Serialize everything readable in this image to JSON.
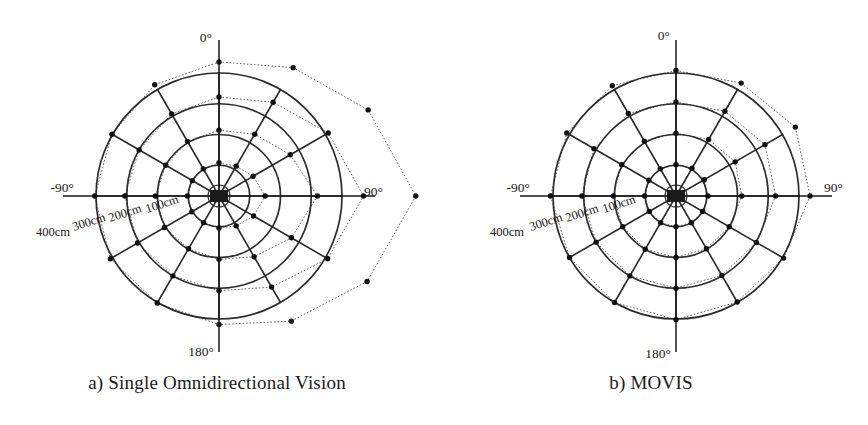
{
  "figure": {
    "background": "#ffffff",
    "ink": "#1a1a1a",
    "grid_color": "#2b2b2b",
    "measured_color": "#555555",
    "point_color": "#111111"
  },
  "panels": [
    {
      "id": "a",
      "caption": "a) Single Omnidirectional Vision",
      "center": {
        "x": 219,
        "y": 196
      },
      "angle_labels": [
        {
          "name": "angle-label-0",
          "text": "0°",
          "x": 212,
          "y": 42,
          "anchor": "end"
        },
        {
          "name": "angle-label-90",
          "text": "90°",
          "x": 364,
          "y": 196,
          "anchor": "start"
        },
        {
          "name": "angle-label-180",
          "text": "180°",
          "x": 214,
          "y": 356,
          "anchor": "end"
        },
        {
          "name": "angle-label-minus90",
          "text": "-90°",
          "x": 74,
          "y": 192,
          "anchor": "end"
        }
      ],
      "radius_labels": [
        {
          "name": "radius-label-100cm",
          "text": "100cm",
          "x": 147,
          "y": 213,
          "rotate": -18
        },
        {
          "name": "radius-label-200cm",
          "text": "200cm",
          "x": 110,
          "y": 222,
          "rotate": -18
        },
        {
          "name": "radius-label-300cm",
          "text": "300cm",
          "x": 74,
          "y": 231,
          "rotate": -18
        },
        {
          "name": "radius-label-400cm",
          "text": "400cm",
          "x": 36,
          "y": 236,
          "rotate": 0
        }
      ]
    },
    {
      "id": "b",
      "caption": "b) MOVIS",
      "center": {
        "x": 242,
        "y": 196
      },
      "angle_labels": [
        {
          "name": "angle-label-0",
          "text": "0°",
          "x": 236,
          "y": 40,
          "anchor": "end"
        },
        {
          "name": "angle-label-90",
          "text": "90°",
          "x": 390,
          "y": 192,
          "anchor": "start"
        },
        {
          "name": "angle-label-180",
          "text": "180°",
          "x": 237,
          "y": 358,
          "anchor": "end"
        },
        {
          "name": "angle-label-minus90",
          "text": "-90°",
          "x": 96,
          "y": 192,
          "anchor": "end"
        }
      ],
      "radius_labels": [
        {
          "name": "radius-label-100cm",
          "text": "100cm",
          "x": 170,
          "y": 213,
          "rotate": -18
        },
        {
          "name": "radius-label-200cm",
          "text": "200cm",
          "x": 133,
          "y": 222,
          "rotate": -18
        },
        {
          "name": "radius-label-300cm",
          "text": "300cm",
          "x": 97,
          "y": 231,
          "rotate": -18
        },
        {
          "name": "radius-label-400cm",
          "text": "400cm",
          "x": 56,
          "y": 236,
          "rotate": 0
        }
      ]
    }
  ],
  "chart_data": [
    {
      "type": "line",
      "subtype": "polar-radar",
      "panel": "a",
      "title": "a) Single Omnidirectional Vision",
      "xlabel": "bearing angle (deg)",
      "ylabel": "distance (cm)",
      "rlim": [
        0,
        400
      ],
      "runit": "cm",
      "rticks": [
        100,
        200,
        300,
        400
      ],
      "rtick_labels": [
        "100cm",
        "200cm",
        "300cm",
        "400cm"
      ],
      "theta_zero_location": "N",
      "theta_direction": "clockwise",
      "thetaticks": [
        0,
        90,
        180,
        -90
      ],
      "thetatick_labels": [
        "0°",
        "90°",
        "180°",
        "-90°"
      ],
      "angles_deg": [
        0,
        30,
        60,
        90,
        120,
        150,
        180,
        210,
        240,
        270,
        300,
        330
      ],
      "grid": true,
      "legend": "none",
      "series": [
        {
          "name": "ground truth 100cm",
          "reference": true,
          "values": [
            100,
            100,
            100,
            100,
            100,
            100,
            100,
            100,
            100,
            100,
            100,
            100
          ]
        },
        {
          "name": "ground truth 200cm",
          "reference": true,
          "values": [
            200,
            200,
            200,
            200,
            200,
            200,
            200,
            200,
            200,
            200,
            200,
            200
          ]
        },
        {
          "name": "ground truth 300cm",
          "reference": true,
          "values": [
            300,
            300,
            300,
            300,
            300,
            300,
            300,
            300,
            300,
            300,
            300,
            300
          ]
        },
        {
          "name": "ground truth 400cm",
          "reference": true,
          "values": [
            400,
            400,
            400,
            400,
            400,
            400,
            400,
            400,
            400,
            400,
            400,
            400
          ]
        },
        {
          "name": "measured 100cm",
          "reference": false,
          "values": [
            108,
            112,
            128,
            150,
            130,
            112,
            104,
            100,
            102,
            103,
            100,
            102
          ]
        },
        {
          "name": "measured 200cm",
          "reference": false,
          "values": [
            214,
            232,
            268,
            320,
            272,
            228,
            206,
            198,
            205,
            207,
            200,
            205
          ]
        },
        {
          "name": "measured 300cm",
          "reference": false,
          "values": [
            322,
            352,
            410,
            470,
            408,
            342,
            308,
            300,
            306,
            306,
            300,
            308
          ]
        },
        {
          "name": "measured 400cm",
          "reference": false,
          "values": [
            436,
            482,
            560,
            640,
            556,
            470,
            418,
            402,
            408,
            404,
            402,
            418
          ]
        }
      ]
    },
    {
      "type": "line",
      "subtype": "polar-radar",
      "panel": "b",
      "title": "b) MOVIS",
      "xlabel": "bearing angle (deg)",
      "ylabel": "distance (cm)",
      "rlim": [
        0,
        400
      ],
      "runit": "cm",
      "rticks": [
        100,
        200,
        300,
        400
      ],
      "rtick_labels": [
        "100cm",
        "200cm",
        "300cm",
        "400cm"
      ],
      "theta_zero_location": "N",
      "theta_direction": "clockwise",
      "thetaticks": [
        0,
        90,
        180,
        -90
      ],
      "thetatick_labels": [
        "0°",
        "90°",
        "180°",
        "-90°"
      ],
      "angles_deg": [
        0,
        30,
        60,
        90,
        120,
        150,
        180,
        210,
        240,
        270,
        300,
        330
      ],
      "grid": true,
      "legend": "none",
      "series": [
        {
          "name": "ground truth 100cm",
          "reference": true,
          "values": [
            100,
            100,
            100,
            100,
            100,
            100,
            100,
            100,
            100,
            100,
            100,
            100
          ]
        },
        {
          "name": "ground truth 200cm",
          "reference": true,
          "values": [
            200,
            200,
            200,
            200,
            200,
            200,
            200,
            200,
            200,
            200,
            200,
            200
          ]
        },
        {
          "name": "ground truth 300cm",
          "reference": true,
          "values": [
            300,
            300,
            300,
            300,
            300,
            300,
            300,
            300,
            300,
            300,
            300,
            300
          ]
        },
        {
          "name": "ground truth 400cm",
          "reference": true,
          "values": [
            400,
            400,
            400,
            400,
            400,
            400,
            400,
            400,
            400,
            400,
            400,
            400
          ]
        },
        {
          "name": "measured 100cm",
          "reference": false,
          "values": [
            102,
            104,
            106,
            104,
            100,
            100,
            100,
            100,
            100,
            102,
            102,
            102
          ]
        },
        {
          "name": "measured 200cm",
          "reference": false,
          "values": [
            204,
            212,
            222,
            214,
            200,
            198,
            200,
            200,
            200,
            204,
            204,
            206
          ]
        },
        {
          "name": "measured 300cm",
          "reference": false,
          "values": [
            306,
            318,
            334,
            324,
            302,
            298,
            300,
            300,
            300,
            306,
            308,
            310
          ]
        },
        {
          "name": "measured 400cm",
          "reference": false,
          "values": [
            408,
            424,
            448,
            436,
            404,
            398,
            402,
            400,
            400,
            408,
            410,
            414
          ]
        }
      ]
    }
  ]
}
